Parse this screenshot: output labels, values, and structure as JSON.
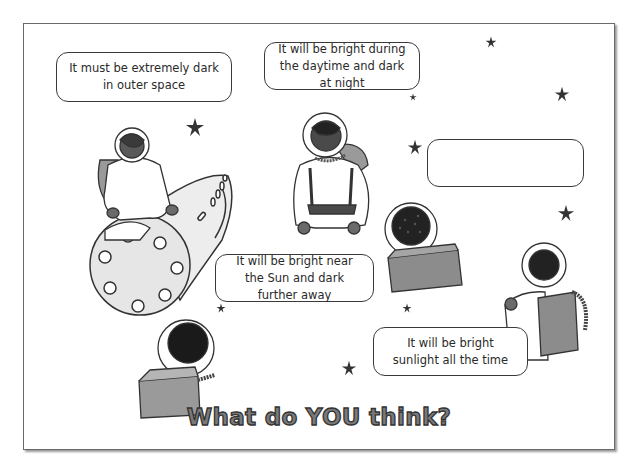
{
  "worksheet": {
    "title": "What do YOU think?",
    "colors": {
      "border": "#6a6a6a",
      "ink": "#2a2a2a",
      "title_fill": "#7a7a7a",
      "title_outline": "#333333",
      "suit": "#ffffff",
      "skin_dark": "#5a5a5a",
      "backpack": "#8c8c8c"
    },
    "bubbles": [
      {
        "id": "dark-outer-space",
        "text": "It must be extremely dark in outer space"
      },
      {
        "id": "day-night",
        "text": "It will be bright during the daytime and dark at night"
      },
      {
        "id": "empty",
        "text": ""
      },
      {
        "id": "near-sun",
        "text": "It will be bright near the Sun and dark further away"
      },
      {
        "id": "always-bright",
        "text": "It will be bright sunlight all the time"
      }
    ],
    "figures": [
      {
        "id": "astronaut-on-rocket"
      },
      {
        "id": "astronaut-standing"
      },
      {
        "id": "astronaut-curly-hair-back"
      },
      {
        "id": "astronaut-right-back"
      },
      {
        "id": "astronaut-bottom-left-back"
      }
    ],
    "icons": [
      "star-icon",
      "rocket-icon",
      "astronaut-icon"
    ]
  }
}
